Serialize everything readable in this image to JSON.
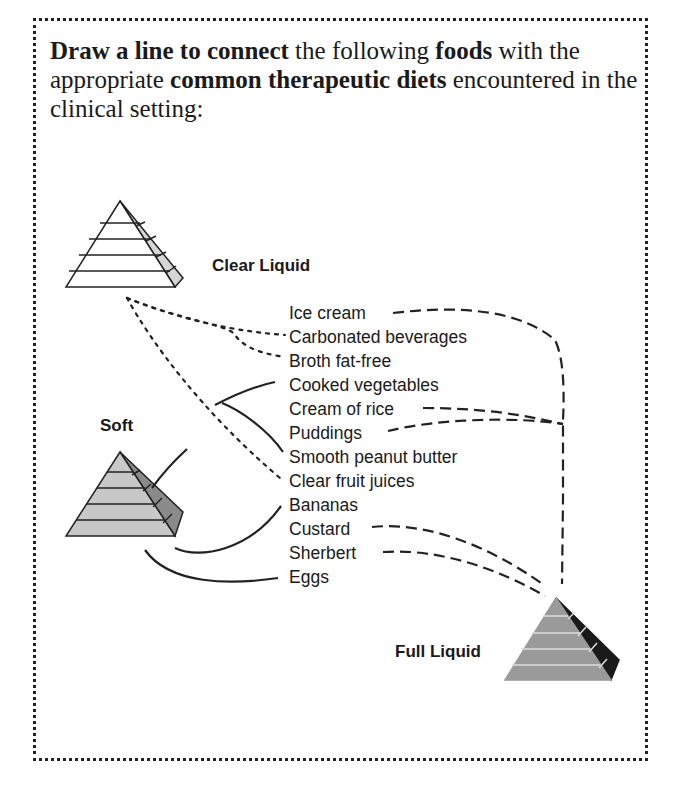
{
  "instructions": {
    "part1_bold": "Draw a line to connect",
    "part2": " the following ",
    "part3_bold": "foods",
    "part4": " with the appropriate ",
    "part5_bold": "common therapeutic diets",
    "part6": " encountered in the clinical setting:"
  },
  "diets": {
    "clear_liquid": "Clear Liquid",
    "soft": "Soft",
    "full_liquid": "Full Liquid"
  },
  "foods": [
    {
      "label": "Ice cream",
      "diet": "Full Liquid"
    },
    {
      "label": "Carbonated beverages",
      "diet": "Clear Liquid"
    },
    {
      "label": "Broth fat-free",
      "diet": "Clear Liquid"
    },
    {
      "label": "Cooked vegetables",
      "diet": "Soft"
    },
    {
      "label": "Cream of rice",
      "diet": "Full Liquid"
    },
    {
      "label": "Puddings",
      "diet": "Full Liquid"
    },
    {
      "label": "Smooth peanut butter",
      "diet": "Soft"
    },
    {
      "label": "Clear fruit juices",
      "diet": "Clear Liquid"
    },
    {
      "label": "Bananas",
      "diet": "Soft"
    },
    {
      "label": "Custard",
      "diet": "Full Liquid"
    },
    {
      "label": "Sherbert",
      "diet": "Full Liquid"
    },
    {
      "label": "Eggs",
      "diet": "Soft"
    }
  ],
  "line_styles": {
    "clear_liquid": "dotted",
    "soft": "solid",
    "full_liquid": "dashed"
  },
  "colors": {
    "clear_pyramid_face": "#ffffff",
    "clear_pyramid_side": "#d6d6d6",
    "soft_pyramid_face": "#c8c8c8",
    "soft_pyramid_side": "#8a8a8a",
    "full_pyramid_face": "#9a9a9a",
    "full_pyramid_side": "#1a1a1a",
    "ink": "#1a1a1a"
  }
}
